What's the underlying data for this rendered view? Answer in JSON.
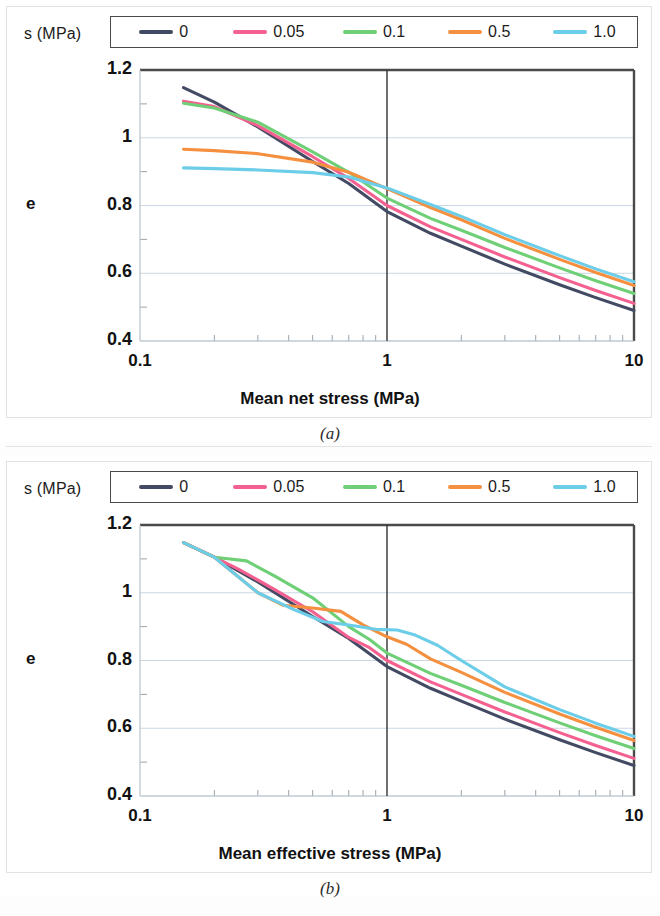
{
  "figure": {
    "panels": [
      {
        "caption": "(a)",
        "legend_title": "s (MPa)",
        "chart_index": 0
      },
      {
        "caption": "(b)",
        "legend_title": "s (MPa)",
        "chart_index": 1
      }
    ]
  },
  "colors": {
    "series_0": "#434a63",
    "series_005": "#f4608f",
    "series_01": "#6fcf77",
    "series_05": "#f49040",
    "series_10": "#6ccde8",
    "axis": "#595959",
    "grid": "#c9d8e4",
    "frame": "#4a4a4a"
  },
  "chart_data": [
    {
      "type": "line",
      "title": "",
      "xlabel": "Mean net stress (MPa)",
      "ylabel": "e",
      "xscale": "log",
      "xlim": [
        0.1,
        10
      ],
      "ylim": [
        0.4,
        1.2
      ],
      "xticks": [
        "0.1",
        "1",
        "10"
      ],
      "xtick_values": [
        0.1,
        1,
        10
      ],
      "yticks": [
        "0.4",
        "0.6",
        "0.8",
        "1",
        "1.2"
      ],
      "ytick_values": [
        0.4,
        0.6,
        0.8,
        1.0,
        1.2
      ],
      "grid": true,
      "legend_position": "top",
      "legend_title": "s (MPa)",
      "annotations": [
        {
          "type": "vline",
          "x": 1,
          "color": "#333333"
        }
      ],
      "series": [
        {
          "name": "0",
          "color": "#434a63",
          "x": [
            0.15,
            0.2,
            0.3,
            0.5,
            0.7,
            1.0,
            1.5,
            2.0,
            3.0,
            5.0,
            7.0,
            10.0
          ],
          "values": [
            1.148,
            1.105,
            1.032,
            0.93,
            0.865,
            0.782,
            0.718,
            0.68,
            0.627,
            0.566,
            0.528,
            0.49
          ]
        },
        {
          "name": "0.05",
          "color": "#f4608f",
          "x": [
            0.15,
            0.2,
            0.3,
            0.5,
            0.7,
            1.0,
            1.5,
            2.0,
            3.0,
            5.0,
            7.0,
            10.0
          ],
          "values": [
            1.108,
            1.092,
            1.036,
            0.944,
            0.88,
            0.8,
            0.737,
            0.7,
            0.648,
            0.587,
            0.549,
            0.511
          ]
        },
        {
          "name": "0.1",
          "color": "#6fcf77",
          "x": [
            0.15,
            0.2,
            0.3,
            0.5,
            0.7,
            1.0,
            1.5,
            2.0,
            3.0,
            5.0,
            7.0,
            10.0
          ],
          "values": [
            1.102,
            1.088,
            1.046,
            0.958,
            0.898,
            0.822,
            0.762,
            0.727,
            0.676,
            0.616,
            0.578,
            0.54
          ]
        },
        {
          "name": "0.5",
          "color": "#f49040",
          "x": [
            0.15,
            0.2,
            0.3,
            0.5,
            0.7,
            1.0,
            1.5,
            2.0,
            3.0,
            5.0,
            7.0,
            10.0
          ],
          "values": [
            0.966,
            0.962,
            0.953,
            0.928,
            0.898,
            0.85,
            0.794,
            0.758,
            0.703,
            0.641,
            0.602,
            0.564
          ]
        },
        {
          "name": "1.0",
          "color": "#6ccde8",
          "x": [
            0.15,
            0.2,
            0.3,
            0.5,
            0.7,
            1.0,
            1.5,
            2.0,
            3.0,
            5.0,
            7.0,
            10.0
          ],
          "values": [
            0.911,
            0.909,
            0.905,
            0.897,
            0.884,
            0.852,
            0.803,
            0.768,
            0.714,
            0.652,
            0.613,
            0.575
          ]
        }
      ]
    },
    {
      "type": "line",
      "title": "",
      "xlabel": "Mean effective stress (MPa)",
      "ylabel": "e",
      "xscale": "log",
      "xlim": [
        0.1,
        10
      ],
      "ylim": [
        0.4,
        1.2
      ],
      "xticks": [
        "0.1",
        "1",
        "10"
      ],
      "xtick_values": [
        0.1,
        1,
        10
      ],
      "yticks": [
        "0.4",
        "0.6",
        "0.8",
        "1",
        "1.2"
      ],
      "ytick_values": [
        0.4,
        0.6,
        0.8,
        1.0,
        1.2
      ],
      "grid": true,
      "legend_position": "top",
      "legend_title": "s (MPa)",
      "annotations": [
        {
          "type": "vline",
          "x": 1,
          "color": "#333333"
        }
      ],
      "series": [
        {
          "name": "0",
          "color": "#434a63",
          "x": [
            0.15,
            0.2,
            0.3,
            0.5,
            0.7,
            1.0,
            1.5,
            2.0,
            3.0,
            5.0,
            7.0,
            10.0
          ],
          "values": [
            1.148,
            1.105,
            1.032,
            0.93,
            0.865,
            0.782,
            0.718,
            0.68,
            0.627,
            0.566,
            0.528,
            0.49
          ]
        },
        {
          "name": "0.05",
          "color": "#f4608f",
          "x": [
            0.15,
            0.2,
            0.25,
            0.35,
            0.5,
            0.7,
            0.85,
            1.0,
            1.5,
            2.0,
            3.0,
            5.0,
            7.0,
            10.0
          ],
          "values": [
            1.148,
            1.105,
            1.07,
            1.01,
            0.944,
            0.868,
            0.838,
            0.8,
            0.737,
            0.7,
            0.648,
            0.587,
            0.549,
            0.511
          ]
        },
        {
          "name": "0.1",
          "color": "#6fcf77",
          "x": [
            0.15,
            0.2,
            0.27,
            0.35,
            0.5,
            0.7,
            0.85,
            1.0,
            1.5,
            2.0,
            3.0,
            5.0,
            7.0,
            10.0
          ],
          "values": [
            1.148,
            1.105,
            1.094,
            1.05,
            0.985,
            0.9,
            0.862,
            0.822,
            0.762,
            0.727,
            0.676,
            0.616,
            0.578,
            0.54
          ]
        },
        {
          "name": "0.5",
          "color": "#f49040",
          "x": [
            0.15,
            0.2,
            0.3,
            0.38,
            0.5,
            0.65,
            0.8,
            1.0,
            1.2,
            1.5,
            2.0,
            3.0,
            5.0,
            7.0,
            10.0
          ],
          "values": [
            1.148,
            1.105,
            1.0,
            0.963,
            0.955,
            0.945,
            0.905,
            0.87,
            0.848,
            0.805,
            0.765,
            0.706,
            0.642,
            0.603,
            0.564
          ]
        },
        {
          "name": "1.0",
          "color": "#6ccde8",
          "x": [
            0.15,
            0.2,
            0.3,
            0.42,
            0.55,
            0.7,
            0.9,
            1.1,
            1.3,
            1.6,
            2.0,
            3.0,
            5.0,
            7.0,
            10.0
          ],
          "values": [
            1.148,
            1.105,
            1.0,
            0.95,
            0.915,
            0.905,
            0.892,
            0.89,
            0.875,
            0.845,
            0.8,
            0.722,
            0.655,
            0.615,
            0.576
          ]
        }
      ]
    }
  ]
}
